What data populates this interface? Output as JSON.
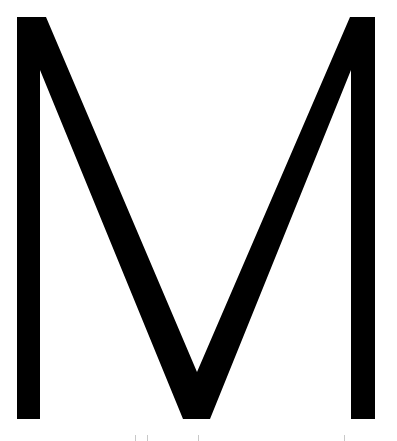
{
  "image": {
    "letter": "M",
    "glyph_color": "#000000",
    "background_color": "#ffffff",
    "tick_color": "#c8c8c8"
  }
}
